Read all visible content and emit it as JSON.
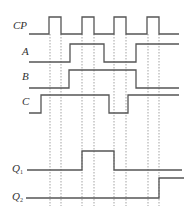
{
  "diagram": {
    "type": "timing-diagram",
    "colors": {
      "line": "#555555",
      "guide": "#666666",
      "text": "#333333",
      "background": "#ffffff"
    },
    "guides": {
      "x": [
        50,
        61,
        82,
        94,
        114,
        126,
        148,
        159
      ],
      "y_top": 34,
      "y_bottom": 206
    },
    "signals": [
      {
        "id": "cp",
        "label": "CP",
        "sub": "",
        "label_x": 13,
        "label_y": 29,
        "high_y": 17,
        "low_y": 34,
        "start_x": 29,
        "end_x": 179,
        "initial": "low",
        "transitions": [
          49,
          61,
          82,
          94,
          114,
          126,
          147,
          159
        ]
      },
      {
        "id": "a",
        "label": "A",
        "sub": "",
        "label_x": 22,
        "label_y": 55,
        "high_y": 44,
        "low_y": 62,
        "start_x": 29,
        "end_x": 179,
        "initial": "low",
        "transitions": [
          70,
          104,
          136
        ]
      },
      {
        "id": "b",
        "label": "B",
        "sub": "",
        "label_x": 22,
        "label_y": 80,
        "high_y": 70,
        "low_y": 88,
        "start_x": 29,
        "end_x": 179,
        "initial": "low",
        "transitions": [
          69,
          136
        ]
      },
      {
        "id": "c",
        "label": "C",
        "sub": "",
        "label_x": 22,
        "label_y": 105,
        "high_y": 95,
        "low_y": 113,
        "start_x": 29,
        "end_x": 179,
        "initial": "low",
        "transitions": [
          41,
          109,
          128
        ]
      },
      {
        "id": "q1",
        "label": "Q",
        "sub": "1",
        "label_x": 12,
        "label_y": 172,
        "high_y": 151,
        "low_y": 170,
        "start_x": 27,
        "end_x": 182,
        "initial": "low",
        "transitions": [
          82,
          114
        ]
      },
      {
        "id": "q2",
        "label": "Q",
        "sub": "2",
        "label_x": 12,
        "label_y": 200,
        "high_y": 178,
        "low_y": 198,
        "start_x": 26,
        "end_x": 184,
        "initial": "low",
        "transitions": [
          159
        ]
      }
    ]
  }
}
